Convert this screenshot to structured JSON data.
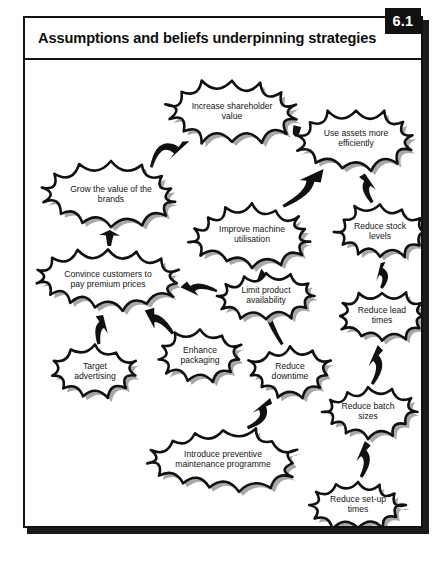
{
  "figure": {
    "title": "Assumptions and beliefs underpinning strategies",
    "number": "6.1"
  },
  "chart_data": {
    "type": "diagram",
    "title": "Assumptions and beliefs underpinning strategies",
    "diagram_style": "cloud-and-arrow causal map",
    "nodes": [
      {
        "id": "increase-shareholder-value",
        "label": "Increase shareholder value",
        "lines": [
          "Increase shareholder",
          "value"
        ],
        "x": 207,
        "y": 52,
        "rx": 66,
        "ry": 33,
        "font": 8.6
      },
      {
        "id": "use-assets-more-efficiently",
        "label": "Use assets more efficiently",
        "lines": [
          "Use assets more",
          "efficiently"
        ],
        "x": 331,
        "y": 79,
        "rx": 59,
        "ry": 31,
        "font": 8.6
      },
      {
        "id": "grow-value-of-brands",
        "label": "Grow the value of the brands",
        "lines": [
          "Grow the value of the",
          "brands"
        ],
        "x": 86,
        "y": 135,
        "rx": 66,
        "ry": 31,
        "font": 8.6
      },
      {
        "id": "improve-machine-utilisation",
        "label": "Improve machine utilisation",
        "lines": [
          "Improve machine",
          "utilisation"
        ],
        "x": 227,
        "y": 175,
        "rx": 60,
        "ry": 30,
        "font": 8.6
      },
      {
        "id": "reduce-stock-levels",
        "label": "Reduce stock levels",
        "lines": [
          "Reduce stock",
          "levels"
        ],
        "x": 355,
        "y": 172,
        "rx": 46,
        "ry": 27,
        "font": 8.6
      },
      {
        "id": "convince-customers-premium",
        "label": "Convince customers to pay premium prices",
        "lines": [
          "Convince customers to",
          "pay premium prices"
        ],
        "x": 83,
        "y": 220,
        "rx": 70,
        "ry": 31,
        "font": 8.6
      },
      {
        "id": "limit-product-availability",
        "label": "Limit product availability",
        "lines": [
          "Limit product",
          "availability"
        ],
        "x": 241,
        "y": 236,
        "rx": 47,
        "ry": 24,
        "font": 8.6
      },
      {
        "id": "reduce-lead-times",
        "label": "Reduce lead times",
        "lines": [
          "Reduce lead",
          "times"
        ],
        "x": 357,
        "y": 256,
        "rx": 44,
        "ry": 25,
        "font": 8.6
      },
      {
        "id": "target-advertising",
        "label": "Target advertising",
        "lines": [
          "Target",
          "advertising"
        ],
        "x": 70,
        "y": 312,
        "rx": 42,
        "ry": 25,
        "font": 8.6
      },
      {
        "id": "enhance-packaging",
        "label": "Enhance packaging",
        "lines": [
          "Enhance",
          "packaging"
        ],
        "x": 175,
        "y": 296,
        "rx": 42,
        "ry": 25,
        "font": 8.6
      },
      {
        "id": "reduce-downtime",
        "label": "Reduce downtime",
        "lines": [
          "Reduce",
          "downtime"
        ],
        "x": 265,
        "y": 312,
        "rx": 41,
        "ry": 25,
        "font": 8.6
      },
      {
        "id": "reduce-batch-sizes",
        "label": "Reduce batch sizes",
        "lines": [
          "Reduce batch",
          "sizes"
        ],
        "x": 343,
        "y": 352,
        "rx": 45,
        "ry": 25,
        "font": 8.6
      },
      {
        "id": "introduce-preventive-maint",
        "label": "Introduce preventive maintenance programme",
        "lines": [
          "Introduce preventive",
          "maintenance programme"
        ],
        "x": 198,
        "y": 400,
        "rx": 73,
        "ry": 31,
        "font": 8.6
      },
      {
        "id": "reduce-set-up-times",
        "label": "Reduce set-up times",
        "lines": [
          "Reduce set-up",
          "times"
        ],
        "x": 333,
        "y": 445,
        "rx": 46,
        "ry": 25,
        "font": 8.6
      }
    ],
    "edges": [
      {
        "id": "edge-brands-to-shareholder",
        "from": "grow-value-of-brands",
        "to": "increase-shareholder-value"
      },
      {
        "id": "edge-assets-to-shareholder",
        "from": "use-assets-more-efficiently",
        "to": "increase-shareholder-value"
      },
      {
        "id": "edge-premium-to-brands",
        "from": "convince-customers-premium",
        "to": "grow-value-of-brands"
      },
      {
        "id": "edge-machine-to-assets",
        "from": "improve-machine-utilisation",
        "to": "use-assets-more-efficiently"
      },
      {
        "id": "edge-stock-to-assets",
        "from": "reduce-stock-levels",
        "to": "use-assets-more-efficiently"
      },
      {
        "id": "edge-limit-to-premium",
        "from": "limit-product-availability",
        "to": "convince-customers-premium"
      },
      {
        "id": "edge-lead-to-stock",
        "from": "reduce-lead-times",
        "to": "reduce-stock-levels"
      },
      {
        "id": "edge-target-to-premium",
        "from": "target-advertising",
        "to": "convince-customers-premium"
      },
      {
        "id": "edge-packaging-to-premium",
        "from": "enhance-packaging",
        "to": "convince-customers-premium"
      },
      {
        "id": "edge-downtime-to-machine",
        "from": "reduce-downtime",
        "to": "improve-machine-utilisation"
      },
      {
        "id": "edge-batch-to-lead",
        "from": "reduce-batch-sizes",
        "to": "reduce-lead-times"
      },
      {
        "id": "edge-maintenance-to-downtime",
        "from": "introduce-preventive-maint",
        "to": "reduce-downtime"
      },
      {
        "id": "edge-setup-to-batch",
        "from": "reduce-set-up-times",
        "to": "reduce-batch-sizes"
      }
    ]
  },
  "colors": {
    "ink": "#111111",
    "cloud_fill": "#ffffff",
    "cloud_shadow": "#a8a8a8",
    "badge_bg": "#111111",
    "badge_text": "#ffffff"
  }
}
